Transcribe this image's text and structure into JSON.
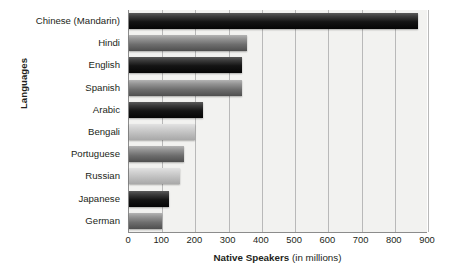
{
  "chart_data": {
    "type": "bar",
    "orientation": "horizontal",
    "title": "",
    "xlabel": "Native Speakers (in millions)",
    "ylabel": "Languages",
    "categories": [
      "Chinese (Mandarin)",
      "Hindi",
      "English",
      "Spanish",
      "Arabic",
      "Bengali",
      "Portuguese",
      "Russian",
      "Japanese",
      "German"
    ],
    "values": [
      870,
      355,
      340,
      340,
      222,
      200,
      165,
      155,
      120,
      100
    ],
    "xlim": [
      0,
      900
    ],
    "xticks": [
      0,
      100,
      200,
      300,
      400,
      500,
      600,
      700,
      800,
      900
    ],
    "xtick_labels": [
      "0",
      "100",
      "200",
      "300",
      "400",
      "500",
      "600",
      "700",
      "800",
      "900"
    ],
    "grid": true,
    "grid_axis": "x",
    "legend": false,
    "series": [
      {
        "name": "Native Speakers",
        "values": [
          870,
          355,
          340,
          340,
          222,
          200,
          165,
          155,
          120,
          100
        ]
      }
    ],
    "bar_shades": [
      "dark",
      "mid",
      "dark",
      "mid",
      "dark",
      "light",
      "mid",
      "light",
      "dark",
      "mid"
    ]
  },
  "axes": {
    "x_title_strong": "Native Speakers",
    "x_title_weak": "(in millions)",
    "y_title": "Languages"
  },
  "colors": {
    "plot_background": "#f2f2f0",
    "gridline": "#b9b9b9",
    "axis_line": "#8c8c8c",
    "text": "#231f20",
    "bar_dark": "#141414",
    "bar_mid": "#6d6d6d",
    "bar_light": "#bdbdbd",
    "page_background": "#ffffff"
  }
}
